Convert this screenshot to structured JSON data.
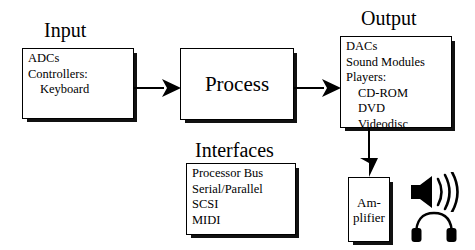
{
  "diagram": {
    "background_color": "#ffffff",
    "line_color": "#000000",
    "shadow_color": "#111111"
  },
  "sections": {
    "input": {
      "title": "Input",
      "items": [
        {
          "text": "ADCs",
          "indent": false
        },
        {
          "text": "Controllers:",
          "indent": false
        },
        {
          "text": "Keyboard",
          "indent": true
        }
      ]
    },
    "process": {
      "label": "Process"
    },
    "output": {
      "title": "Output",
      "items": [
        {
          "text": "DACs",
          "indent": false
        },
        {
          "text": "Sound Modules",
          "indent": false
        },
        {
          "text": "Players:",
          "indent": false
        },
        {
          "text": "CD-ROM",
          "indent": true
        },
        {
          "text": "DVD",
          "indent": true
        },
        {
          "text": "Videodisc",
          "indent": true
        }
      ]
    },
    "interfaces": {
      "title": "Interfaces",
      "items": [
        {
          "text": "Processor Bus",
          "indent": false
        },
        {
          "text": "Serial/Parallel",
          "indent": false
        },
        {
          "text": "SCSI",
          "indent": false
        },
        {
          "text": "MIDI",
          "indent": false
        }
      ]
    },
    "amplifier": {
      "line1": "Am-",
      "line2": "plifier"
    }
  },
  "connectors": [
    {
      "name": "input-to-process",
      "from": "input",
      "to": "process",
      "direction": "right"
    },
    {
      "name": "process-to-output",
      "from": "process",
      "to": "output",
      "direction": "right"
    },
    {
      "name": "output-to-amplifier",
      "from": "output",
      "to": "amplifier",
      "direction": "down"
    }
  ],
  "icons": [
    {
      "name": "speaker-icon",
      "label": "Speaker"
    },
    {
      "name": "headphones-icon",
      "label": "Headphones"
    }
  ]
}
